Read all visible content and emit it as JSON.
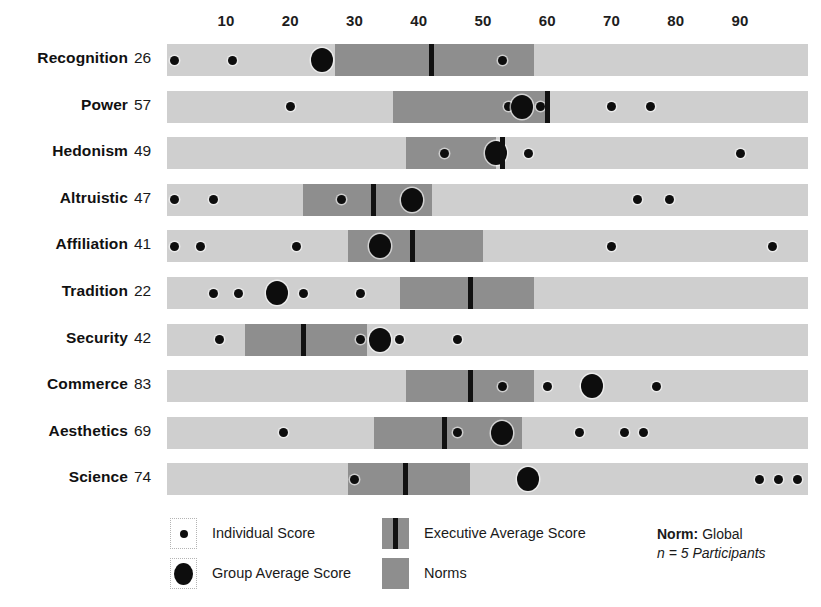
{
  "chart_data": {
    "type": "bar",
    "title": "",
    "xlabel": "",
    "ylabel": "",
    "xlim": [
      0,
      100
    ],
    "grid": false,
    "axis_ticks": [
      10,
      20,
      30,
      40,
      50,
      60,
      70,
      80,
      90
    ],
    "categories": [
      "Recognition",
      "Power",
      "Hedonism",
      "Altruistic",
      "Affiliation",
      "Tradition",
      "Security",
      "Commerce",
      "Aesthetics",
      "Science"
    ],
    "scores": [
      26,
      57,
      49,
      47,
      41,
      22,
      42,
      83,
      69,
      74
    ],
    "rows": [
      {
        "label": "Recognition",
        "score": 26,
        "norms_range": [
          27,
          58
        ],
        "executive_average": 42,
        "group_average": 25,
        "individual_scores": [
          2,
          11,
          53
        ]
      },
      {
        "label": "Power",
        "score": 57,
        "norms_range": [
          36,
          60
        ],
        "executive_average": 60,
        "group_average": 56,
        "individual_scores": [
          20,
          54,
          59,
          70,
          76
        ]
      },
      {
        "label": "Hedonism",
        "score": 49,
        "norms_range": [
          38,
          52
        ],
        "executive_average": 53,
        "group_average": 52,
        "individual_scores": [
          44,
          57,
          90
        ]
      },
      {
        "label": "Altruistic",
        "score": 47,
        "norms_range": [
          22,
          42
        ],
        "executive_average": 33,
        "group_average": 39,
        "individual_scores": [
          2,
          8,
          28,
          74,
          79
        ]
      },
      {
        "label": "Affiliation",
        "score": 41,
        "norms_range": [
          29,
          50
        ],
        "executive_average": 39,
        "group_average": 34,
        "individual_scores": [
          2,
          6,
          21,
          70,
          95
        ]
      },
      {
        "label": "Tradition",
        "score": 22,
        "norms_range": [
          37,
          58
        ],
        "executive_average": 48,
        "group_average": 18,
        "individual_scores": [
          8,
          12,
          18,
          22,
          31
        ]
      },
      {
        "label": "Security",
        "score": 42,
        "norms_range": [
          13,
          32
        ],
        "executive_average": 22,
        "group_average": 34,
        "individual_scores": [
          9,
          31,
          37,
          46
        ]
      },
      {
        "label": "Commerce",
        "score": 83,
        "norms_range": [
          38,
          58
        ],
        "executive_average": 48,
        "group_average": 67,
        "individual_scores": [
          53,
          60,
          66,
          77
        ]
      },
      {
        "label": "Aesthetics",
        "score": 69,
        "norms_range": [
          33,
          56
        ],
        "executive_average": 44,
        "group_average": 53,
        "individual_scores": [
          19,
          46,
          65,
          72,
          75
        ]
      },
      {
        "label": "Science",
        "score": 74,
        "norms_range": [
          29,
          48
        ],
        "executive_average": 38,
        "group_average": 57,
        "individual_scores": [
          30,
          93,
          96,
          99
        ]
      }
    ],
    "colors": {
      "track": "#cfcfcf",
      "norms": "#8e8e8e",
      "marker": "#0d0d0d",
      "executive_line": "#111111",
      "text": "#1a1a1a"
    }
  },
  "legend": {
    "items": [
      {
        "key": "individual",
        "label": "Individual Score",
        "swatch": "small-dot-icon"
      },
      {
        "key": "group",
        "label": "Group Average Score",
        "swatch": "large-dot-icon"
      },
      {
        "key": "executive",
        "label": "Executive Average Score",
        "swatch": "vertical-line-icon"
      },
      {
        "key": "norms",
        "label": "Norms",
        "swatch": "norms-band-icon"
      }
    ]
  },
  "norm_note": {
    "label": "Norm:",
    "value": "Global",
    "participants": "n = 5 Participants"
  }
}
